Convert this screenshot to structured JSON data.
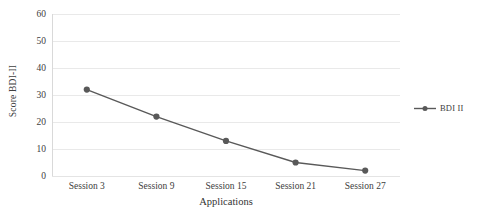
{
  "chart_data": {
    "type": "line",
    "title": "",
    "xlabel": "Applications",
    "ylabel": "Score BDI-II",
    "categories": [
      "Session 3",
      "Session 9",
      "Session 15",
      "Session 21",
      "Session 27"
    ],
    "series": [
      {
        "name": "BDI II",
        "values": [
          32,
          22,
          13,
          5,
          2
        ],
        "color": "#595959",
        "marker": "circle"
      }
    ],
    "ylim": [
      0,
      60
    ],
    "yticks": [
      0,
      10,
      20,
      30,
      40,
      50,
      60
    ],
    "ytick_labels": [
      "0",
      "10",
      "20",
      "30",
      "40",
      "50",
      "60"
    ],
    "grid": "horizontal",
    "legend_position": "right",
    "legend_entries": [
      "BDI II"
    ],
    "colors": {
      "line": "#595959",
      "marker": "#595959",
      "gridline": "#e9e9e9",
      "text": "#404040",
      "background": "#ffffff"
    }
  }
}
